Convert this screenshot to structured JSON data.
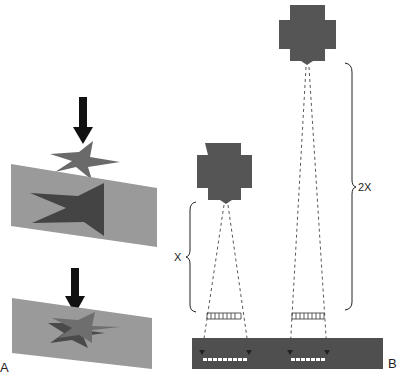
{
  "figure": {
    "panels": [
      {
        "id": "A",
        "label": "A",
        "description": "Magnification/distortion: object star projected onto image plane",
        "elements": [
          "arrow",
          "object-star",
          "image-plane-with-large-star-shadow",
          "arrow",
          "image-plane-with-overlapping-stars"
        ]
      },
      {
        "id": "B",
        "label": "B",
        "description": "Source-to-object distance comparison",
        "distance_labels": {
          "short": "X",
          "long": "2X"
        }
      }
    ],
    "colors": {
      "source": "#555555",
      "star_object": "#6a6a6a",
      "star_shadow": "#444444",
      "plane": "#9a9a9a",
      "receptor": "#4f4f4f",
      "arrow": "#111111",
      "bracket": "#222222",
      "dash": "#444444",
      "image_dash": "#ffffff"
    }
  }
}
